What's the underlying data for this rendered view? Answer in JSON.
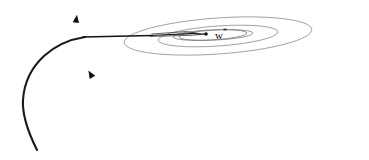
{
  "figure": {
    "alt_title": "Gradient descent trajectory converging to optimum on elliptical contours",
    "background_color": "#ffffff",
    "width": 369,
    "height": 160
  },
  "labels": {
    "optimum_symbol": "w",
    "optimum_superscript": "*",
    "optimum_text": "w*",
    "optimum_position": {
      "x": 215,
      "y": 28
    }
  },
  "chart_data": {
    "type": "line",
    "title": "",
    "xlabel": "",
    "ylabel": "",
    "grid": false,
    "legend": null,
    "xlim": [
      0,
      369
    ],
    "ylim": [
      160,
      0
    ],
    "contours": {
      "type": "ellipse",
      "count": 4,
      "center": {
        "x": 218,
        "y": 36
      },
      "stroke_color": "#7d7d7d",
      "rings": [
        {
          "index": 1,
          "rx": 132,
          "ry": 27,
          "rotation_deg": -4,
          "label": "outermost-contour"
        },
        {
          "index": 2,
          "rx": 94,
          "ry": 18,
          "rotation_deg": -4,
          "label": "outer-mid-contour"
        },
        {
          "index": 3,
          "rx": 60,
          "ry": 10,
          "rotation_deg": -3,
          "label": "inner-mid-contour"
        },
        {
          "index": 4,
          "rx": 37,
          "ry": 5,
          "rotation_deg": -3,
          "label": "innermost-contour"
        }
      ]
    },
    "trajectory": {
      "stroke_color": "#1a1a1a",
      "points": [
        {
          "x": 37,
          "y": 150
        },
        {
          "x": 25,
          "y": 120
        },
        {
          "x": 23,
          "y": 100
        },
        {
          "x": 28,
          "y": 76
        },
        {
          "x": 42,
          "y": 57
        },
        {
          "x": 62,
          "y": 44
        },
        {
          "x": 80,
          "y": 38
        },
        {
          "x": 95,
          "y": 36
        },
        {
          "x": 128,
          "y": 36
        },
        {
          "x": 145,
          "y": 35
        },
        {
          "x": 175,
          "y": 33
        },
        {
          "x": 196,
          "y": 35
        },
        {
          "x": 205,
          "y": 34
        }
      ],
      "arrow_markers": [
        {
          "x": 25,
          "y": 102,
          "angle_deg": -80,
          "label": "arrow-1-ascending"
        },
        {
          "x": 42,
          "y": 57,
          "angle_deg": -40,
          "label": "arrow-2-turning"
        },
        {
          "x": 95,
          "y": 36,
          "angle_deg": -2,
          "label": "arrow-3-entering-contours"
        },
        {
          "x": 146,
          "y": 35,
          "angle_deg": -2,
          "label": "arrow-4-inner-contour"
        },
        {
          "x": 198,
          "y": 34,
          "angle_deg": 2,
          "label": "arrow-5-near-optimum"
        }
      ]
    },
    "optimum_point": {
      "x": 206,
      "y": 34,
      "label": "w*"
    }
  }
}
